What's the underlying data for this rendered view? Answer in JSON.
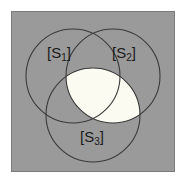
{
  "figure": {
    "kind": "venn-diagram",
    "sets_count": 3,
    "panel": {
      "background_color": "#9a9a9a",
      "border_color": "#7a7a7a",
      "x": 11,
      "y": 11,
      "width": 164,
      "height": 161
    },
    "outer_background_color": "#ffffff",
    "circle_stroke_color": "#3a3a3a",
    "circle_fill_color": "#9a9a9a",
    "highlight_fill_color": "#fbfbf2",
    "label_color": "#1a1a1a",
    "circles": [
      {
        "id": "s1",
        "name": "set-circle-s1",
        "cx": 73,
        "cy": 76,
        "r": 47
      },
      {
        "id": "s2",
        "name": "set-circle-s2",
        "cx": 113,
        "cy": 76,
        "r": 47
      },
      {
        "id": "s3",
        "name": "set-circle-s3",
        "cx": 93,
        "cy": 115,
        "r": 47
      }
    ],
    "highlight": {
      "name": "intersection-highlight-s2-s3",
      "description": "shaded lens where S2 and S3 overlap"
    },
    "labels": [
      {
        "id": "s1",
        "bracket_open": "[",
        "base": "S",
        "sub": "1",
        "bracket_close": "]",
        "x": 59,
        "y": 54
      },
      {
        "id": "s2",
        "bracket_open": "[",
        "base": "S",
        "sub": "2",
        "bracket_close": "]",
        "x": 124,
        "y": 54
      },
      {
        "id": "s3",
        "bracket_open": "[",
        "base": "S",
        "sub": "3",
        "bracket_close": "]",
        "x": 92,
        "y": 138
      }
    ]
  }
}
